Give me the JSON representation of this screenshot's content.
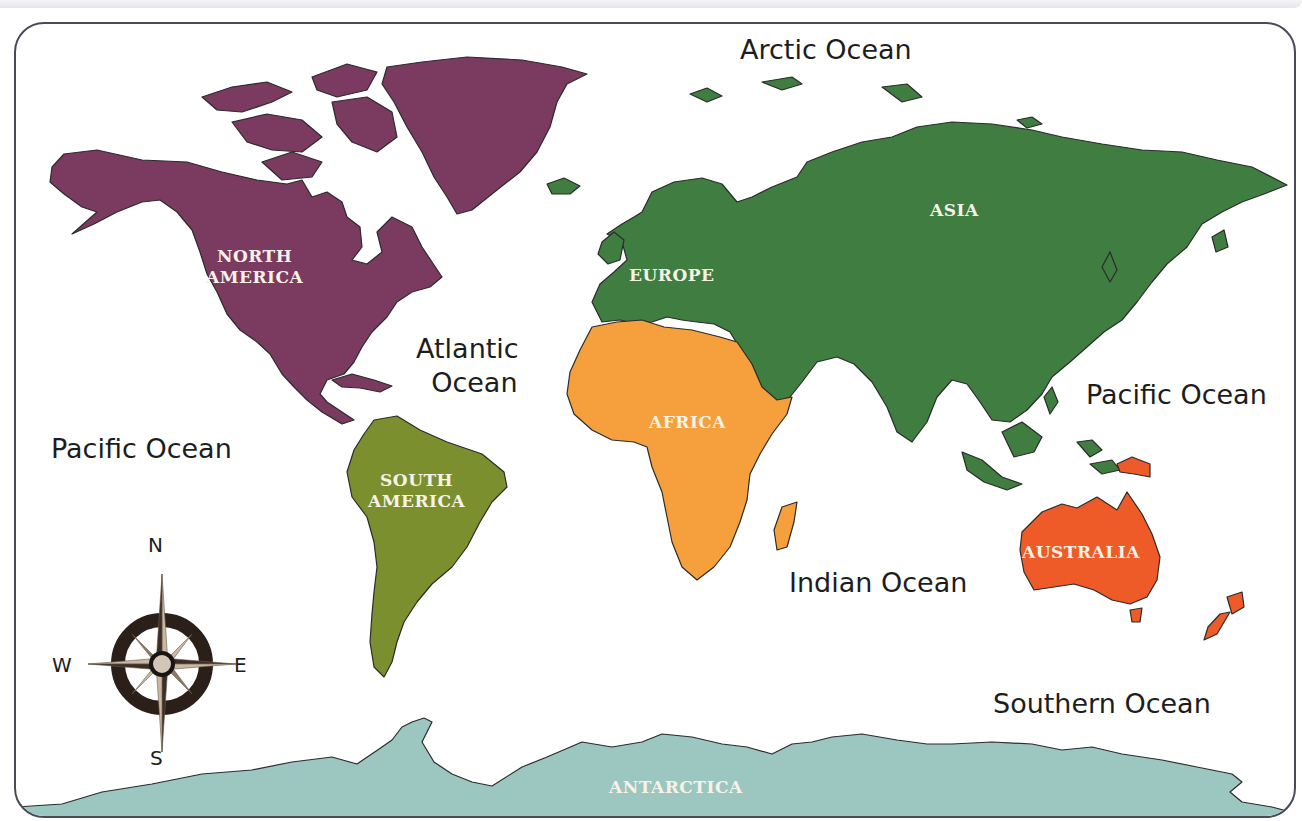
{
  "map": {
    "title": "World Map - Continents and Oceans",
    "colors": {
      "north_america": "#7b3a5f",
      "south_america": "#7b8f2f",
      "europe_asia": "#3f7d40",
      "africa": "#f5a03d",
      "australia": "#ee5b28",
      "antarctica": "#9cc6c0",
      "border": "#4a4a58"
    },
    "continents": [
      {
        "id": "north-america",
        "label_line1": "NORTH",
        "label_line2": "AMERICA"
      },
      {
        "id": "south-america",
        "label_line1": "SOUTH",
        "label_line2": "AMERICA"
      },
      {
        "id": "europe",
        "label_line1": "EUROPE"
      },
      {
        "id": "asia",
        "label_line1": "ASIA"
      },
      {
        "id": "africa",
        "label_line1": "AFRICA"
      },
      {
        "id": "australia",
        "label_line1": "AUSTRALIA"
      },
      {
        "id": "antarctica",
        "label_line1": "ANTARCTICA"
      }
    ],
    "oceans": [
      {
        "id": "arctic",
        "label": "Arctic Ocean"
      },
      {
        "id": "atlantic",
        "label_line1": "Atlantic",
        "label_line2": "Ocean"
      },
      {
        "id": "pacific-west",
        "label": "Pacific Ocean"
      },
      {
        "id": "pacific-east",
        "label": "Pacific Ocean"
      },
      {
        "id": "indian",
        "label": "Indian Ocean"
      },
      {
        "id": "southern",
        "label": "Southern Ocean"
      }
    ],
    "compass": {
      "north": "N",
      "south": "S",
      "east": "E",
      "west": "W"
    }
  }
}
